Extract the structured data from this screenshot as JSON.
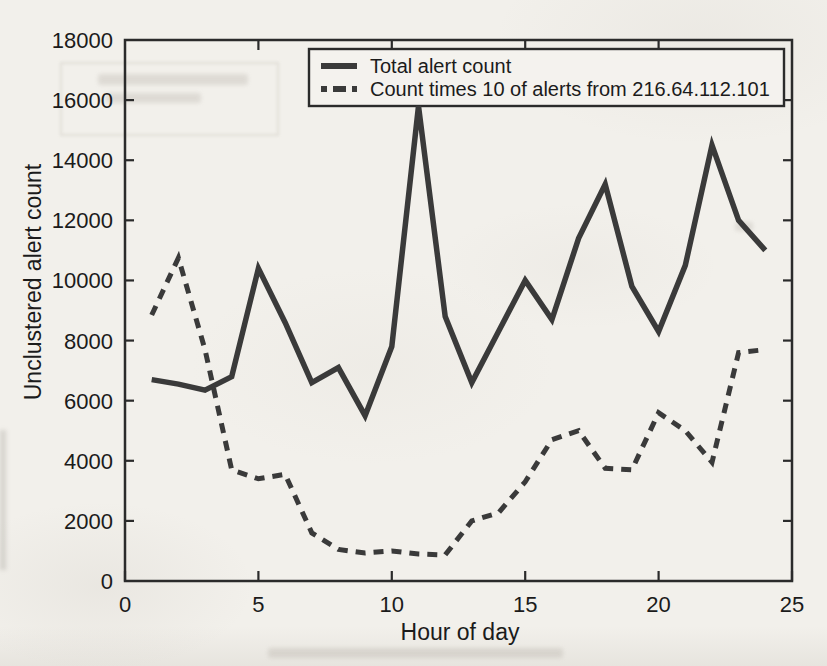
{
  "page": {
    "background_color": "#f2f0eb",
    "line_color": "#3a3a3a",
    "axis_color": "#2b2b2b",
    "text_color": "#1b1b1b"
  },
  "chart_data": {
    "type": "line",
    "title": "",
    "xlabel": "Hour of day",
    "ylabel": "Unclustered alert count",
    "xlim": [
      0,
      25
    ],
    "ylim": [
      0,
      18000
    ],
    "xticks": [
      0,
      5,
      10,
      15,
      20,
      25
    ],
    "xticks_top": [
      5,
      10,
      15,
      20
    ],
    "yticks": [
      0,
      2000,
      4000,
      6000,
      8000,
      10000,
      12000,
      14000,
      16000,
      18000
    ],
    "ytick_labels": [
      "0",
      "2000",
      "4000",
      "6000",
      "8000",
      "10000",
      "12000",
      "14000",
      "16000",
      "18000"
    ],
    "grid": false,
    "legend_position": "top-center-inside",
    "x": [
      1,
      2,
      3,
      4,
      5,
      6,
      7,
      8,
      9,
      10,
      11,
      12,
      13,
      14,
      15,
      16,
      17,
      18,
      19,
      20,
      21,
      22,
      23,
      24
    ],
    "series": [
      {
        "name": "Total alert count",
        "style": "solid",
        "color": "#3a3a3a",
        "values": [
          6700,
          6550,
          6350,
          6800,
          10400,
          8600,
          6600,
          7100,
          5500,
          7800,
          15800,
          8800,
          6600,
          8300,
          10000,
          8700,
          11400,
          13200,
          9800,
          8300,
          10500,
          14500,
          12000,
          11000
        ]
      },
      {
        "name": "Count times 10 of alerts from 216.64.112.101",
        "style": "dashed",
        "color": "#3a3a3a",
        "values": [
          8850,
          10750,
          7700,
          3700,
          3400,
          3550,
          1600,
          1050,
          930,
          1000,
          900,
          870,
          2000,
          2270,
          3300,
          4700,
          5000,
          3750,
          3700,
          5600,
          5000,
          3950,
          7600,
          7700
        ]
      }
    ]
  }
}
